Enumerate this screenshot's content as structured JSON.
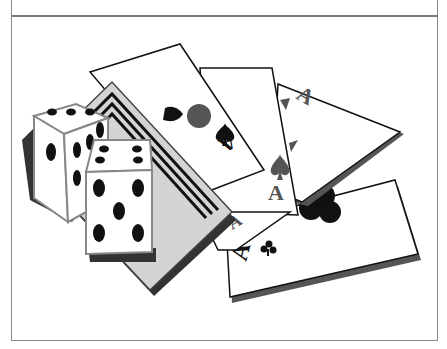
{
  "figure": {
    "caption_visible": false,
    "colors": {
      "border": "#8a8a8a",
      "card_face": "#ffffff",
      "card_outline": "#111111",
      "card_shadow": "#555555",
      "back_card": "#d4d4d4",
      "pip": "#111111",
      "gray_pip": "#555555"
    },
    "dice": [
      {
        "name": "back-die",
        "top_face": 3,
        "front_face": 1,
        "side_face": 4
      },
      {
        "name": "front-die",
        "top_face": 4,
        "front_face": 5
      }
    ],
    "cards": [
      {
        "name": "card-back",
        "label": ""
      },
      {
        "name": "ace-of-spades-1",
        "rank": "A",
        "suit": "spade"
      },
      {
        "name": "ace-of-spades-2",
        "rank": "A",
        "suit": "spade"
      },
      {
        "name": "ace-card-3",
        "rank": "A",
        "suit": "spade"
      },
      {
        "name": "ace-of-clubs",
        "rank": "A",
        "suit": "club"
      }
    ]
  }
}
